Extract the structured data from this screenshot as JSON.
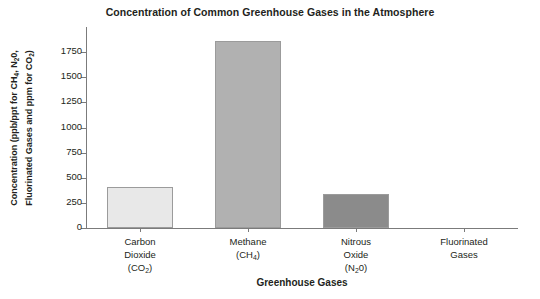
{
  "chart_data": {
    "type": "bar",
    "title": "Concentration of Common Greenhouse Gases in the Atmosphere",
    "xlabel": "Greenhouse Gases",
    "ylabel": "Concentration (ppb/ppt for CH₄, N₂0, Fluorinated Gases and ppm for CO₂)",
    "ylabel_line1": "Concentration (ppb/ppt for CH₄, N₂0,",
    "ylabel_line2": "Fluorinated Gases and ppm for CO₂)",
    "categories": [
      "Carbon Dioxide (CO₂)",
      "Methane (CH₄)",
      "Nitrous Oxide (N₂0)",
      "Fluorinated Gases"
    ],
    "category_lines": [
      [
        "Carbon",
        "Dioxide",
        "(CO₂)"
      ],
      [
        "Methane",
        "(CH₄)"
      ],
      [
        "Nitrous",
        "Oxide",
        "(N₂0)"
      ],
      [
        "Fluorinated",
        "Gases"
      ]
    ],
    "values": [
      410,
      1860,
      340,
      0
    ],
    "bar_colors": [
      "#e8e8e8",
      "#b1b1b1",
      "#8b8b8b",
      "#8b8b8b"
    ],
    "bar_edge_color": "#9b9b9b",
    "ylim": [
      0,
      2000
    ],
    "yticks": [
      0,
      250,
      500,
      750,
      1000,
      1250,
      1500,
      1750
    ],
    "ytick_labels": [
      "0",
      "250",
      "500",
      "750",
      "1000",
      "1250",
      "1500",
      "1750"
    ],
    "grid": false,
    "legend": "none",
    "axis_color": "#7b7b7b",
    "background": "#ffffff"
  }
}
